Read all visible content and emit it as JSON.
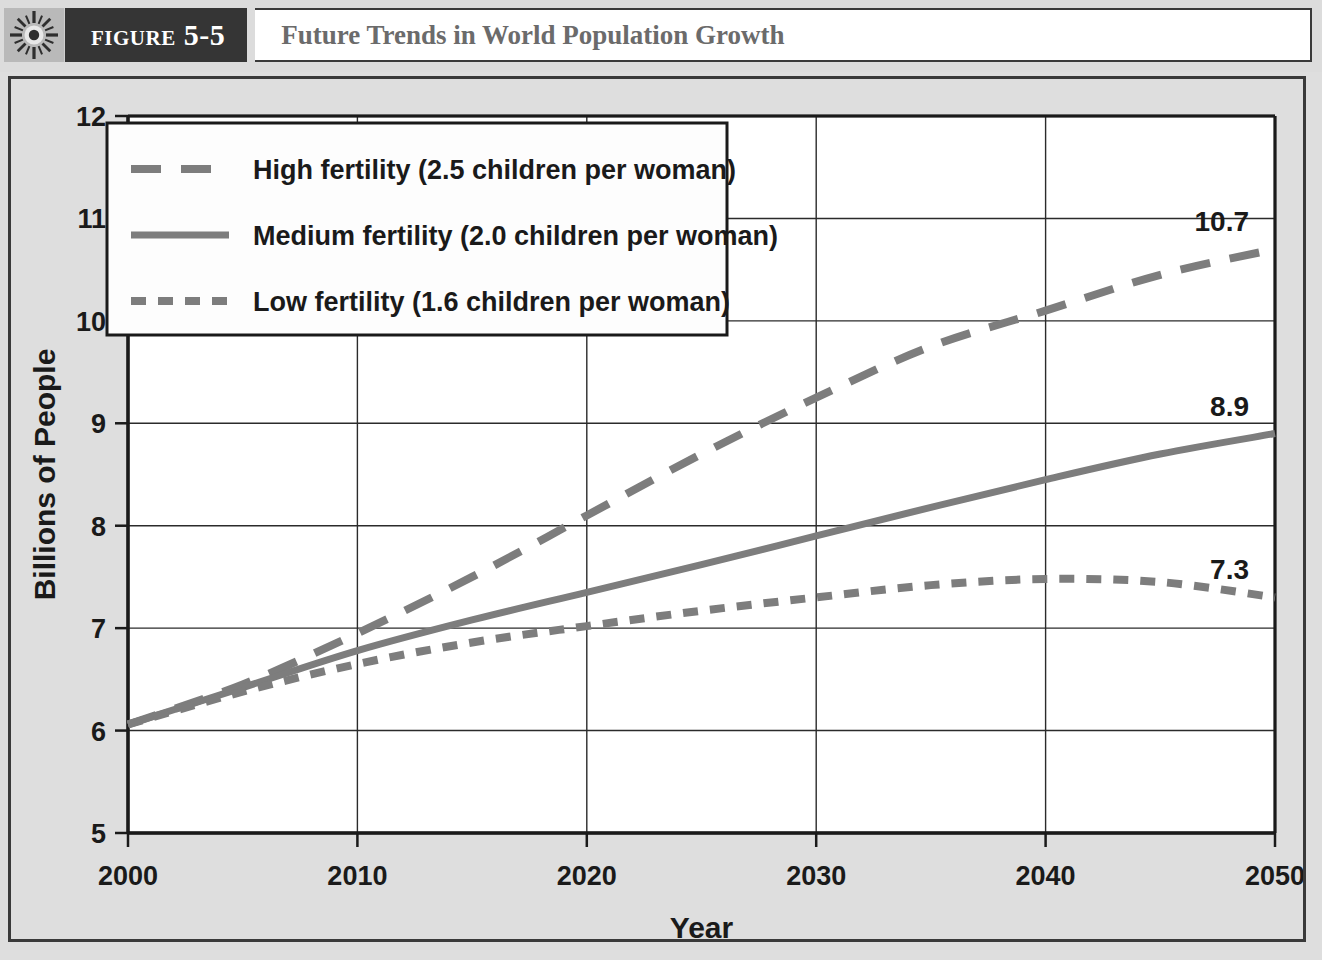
{
  "header": {
    "icon": "sunburst-icon",
    "figure_tag": "Figure 5-5",
    "title": "Future Trends in World Population Growth"
  },
  "colors": {
    "header_tag_bg": "#353535",
    "title_text": "#6b6b6b",
    "page_bg": "#dedede",
    "plot_bg": "#ffffff",
    "axis": "#1a1a1a",
    "grid": "#2b2b2b",
    "series_line": "#7d7d7d",
    "label_text": "#1a1a1a"
  },
  "chart_data": {
    "type": "line",
    "title": "Future Trends in World Population Growth",
    "xlabel": "Year",
    "ylabel": "Billions of People",
    "xlim": [
      2000,
      2050
    ],
    "ylim": [
      5,
      12
    ],
    "grid": true,
    "legend_position": "top-left-inside",
    "x_ticks": [
      "2000",
      "2010",
      "2020",
      "2030",
      "2040",
      "2050"
    ],
    "y_ticks": [
      "5",
      "6",
      "7",
      "8",
      "9",
      "10",
      "11",
      "12"
    ],
    "x": [
      2000,
      2005,
      2010,
      2015,
      2020,
      2025,
      2030,
      2035,
      2040,
      2045,
      2050
    ],
    "series": [
      {
        "name": "High fertility (2.5 children per woman)",
        "key": "high",
        "dash": "long-dash",
        "values": [
          6.06,
          6.45,
          6.95,
          7.5,
          8.1,
          8.7,
          9.25,
          9.75,
          10.1,
          10.45,
          10.7
        ],
        "end_label": "10.7"
      },
      {
        "name": "Medium fertility (2.0 children per woman)",
        "key": "medium",
        "dash": "solid",
        "values": [
          6.06,
          6.42,
          6.78,
          7.08,
          7.35,
          7.62,
          7.9,
          8.18,
          8.45,
          8.7,
          8.9
        ],
        "end_label": "8.9"
      },
      {
        "name": "Low fertility (1.6 children per woman)",
        "key": "low",
        "dash": "short-dash",
        "values": [
          6.06,
          6.38,
          6.65,
          6.86,
          7.02,
          7.17,
          7.3,
          7.42,
          7.48,
          7.45,
          7.3
        ],
        "end_label": "7.3"
      }
    ],
    "legend": [
      "High fertility (2.5 children per woman)",
      "Medium fertility (2.0 children per woman)",
      "Low fertility (1.6 children per woman)"
    ],
    "end_labels": [
      "10.7",
      "8.9",
      "7.3"
    ]
  }
}
